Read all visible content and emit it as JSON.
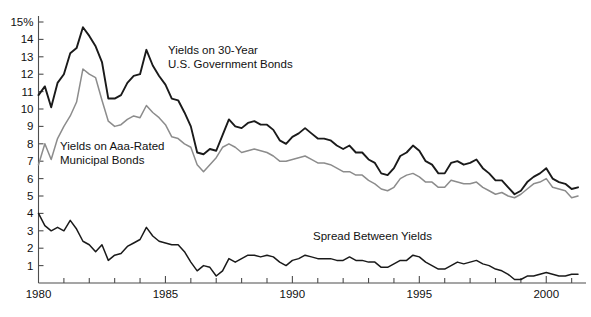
{
  "chart_data": {
    "type": "line",
    "title": "",
    "subtitle": "",
    "xlabel": "",
    "ylabel": "",
    "xlim": [
      1980,
      2001.25
    ],
    "ylim": [
      0,
      15.4
    ],
    "grid": false,
    "legend_position": "inline-annotations",
    "y_ticks": [
      1,
      2,
      3,
      4,
      5,
      6,
      7,
      8,
      9,
      10,
      11,
      12,
      13,
      14,
      15
    ],
    "y_tick_labels": [
      "1",
      "2",
      "3",
      "4",
      "5",
      "6",
      "7",
      "8",
      "9",
      "10",
      "11",
      "12",
      "13",
      "14",
      "15%"
    ],
    "x_ticks": [
      1980,
      1985,
      1990,
      1995,
      2000
    ],
    "x_tick_labels": [
      "1980",
      "1985",
      "1990",
      "2000",
      "2000"
    ],
    "x_minor_tick_step": 1,
    "x": [
      1980.0,
      1980.25,
      1980.5,
      1980.75,
      1981.0,
      1981.25,
      1981.5,
      1981.75,
      1982.0,
      1982.25,
      1982.5,
      1982.75,
      1983.0,
      1983.25,
      1983.5,
      1983.75,
      1984.0,
      1984.25,
      1984.5,
      1984.75,
      1985.0,
      1985.25,
      1985.5,
      1985.75,
      1986.0,
      1986.25,
      1986.5,
      1986.75,
      1987.0,
      1987.25,
      1987.5,
      1987.75,
      1988.0,
      1988.25,
      1988.5,
      1988.75,
      1989.0,
      1989.25,
      1989.5,
      1989.75,
      1990.0,
      1990.25,
      1990.5,
      1990.75,
      1991.0,
      1991.25,
      1991.5,
      1991.75,
      1992.0,
      1992.25,
      1992.5,
      1992.75,
      1993.0,
      1993.25,
      1993.5,
      1993.75,
      1994.0,
      1994.25,
      1994.5,
      1994.75,
      1995.0,
      1995.25,
      1995.5,
      1995.75,
      1996.0,
      1996.25,
      1996.5,
      1996.75,
      1997.0,
      1997.25,
      1997.5,
      1997.75,
      1998.0,
      1998.25,
      1998.5,
      1998.75,
      1999.0,
      1999.25,
      1999.5,
      1999.75,
      2000.0,
      2000.25,
      2000.5,
      2000.75,
      2001.0,
      2001.25
    ],
    "series": [
      {
        "name": "Yields on 30-Year U.S. Government Bonds",
        "color": "#1a1a1a",
        "width": 1.9,
        "values": [
          10.8,
          11.3,
          10.1,
          11.5,
          12.0,
          13.2,
          13.5,
          14.7,
          14.2,
          13.6,
          12.7,
          10.6,
          10.6,
          10.8,
          11.5,
          11.9,
          12.0,
          13.4,
          12.5,
          11.9,
          11.4,
          10.6,
          10.5,
          9.8,
          9.0,
          7.5,
          7.4,
          7.7,
          7.6,
          8.5,
          9.4,
          9.0,
          8.9,
          9.2,
          9.3,
          9.1,
          9.1,
          8.8,
          8.2,
          8.0,
          8.4,
          8.6,
          8.9,
          8.6,
          8.3,
          8.3,
          8.2,
          7.9,
          7.7,
          7.9,
          7.5,
          7.5,
          7.1,
          6.9,
          6.3,
          6.2,
          6.6,
          7.3,
          7.5,
          7.9,
          7.6,
          7.0,
          6.8,
          6.3,
          6.3,
          6.9,
          7.0,
          6.8,
          6.9,
          7.1,
          6.6,
          6.3,
          5.9,
          5.9,
          5.5,
          5.1,
          5.3,
          5.8,
          6.1,
          6.3,
          6.6,
          6.0,
          5.8,
          5.7,
          5.4,
          5.5
        ]
      },
      {
        "name": "Yields on Aaa-Rated Municipal Bonds",
        "color": "#8c8c8c",
        "width": 1.5,
        "values": [
          6.8,
          8.0,
          7.1,
          8.3,
          9.0,
          9.6,
          10.4,
          12.3,
          12.0,
          11.8,
          10.5,
          9.3,
          9.0,
          9.1,
          9.4,
          9.6,
          9.5,
          10.2,
          9.8,
          9.5,
          9.1,
          8.4,
          8.3,
          8.0,
          7.8,
          6.8,
          6.4,
          6.8,
          7.2,
          7.8,
          8.0,
          7.8,
          7.5,
          7.6,
          7.7,
          7.6,
          7.5,
          7.3,
          7.0,
          7.0,
          7.1,
          7.2,
          7.3,
          7.1,
          6.9,
          6.9,
          6.8,
          6.6,
          6.4,
          6.4,
          6.2,
          6.2,
          5.9,
          5.7,
          5.4,
          5.3,
          5.5,
          6.0,
          6.2,
          6.3,
          6.1,
          5.8,
          5.8,
          5.5,
          5.5,
          5.9,
          5.8,
          5.7,
          5.7,
          5.8,
          5.5,
          5.3,
          5.1,
          5.2,
          5.0,
          4.9,
          5.1,
          5.4,
          5.7,
          5.8,
          6.0,
          5.5,
          5.4,
          5.3,
          4.9,
          5.0
        ]
      },
      {
        "name": "Spread Between Yields",
        "color": "#1a1a1a",
        "width": 1.5,
        "values": [
          4.0,
          3.3,
          3.0,
          3.2,
          3.0,
          3.6,
          3.1,
          2.4,
          2.2,
          1.8,
          2.2,
          1.3,
          1.6,
          1.7,
          2.1,
          2.3,
          2.5,
          3.2,
          2.7,
          2.4,
          2.3,
          2.2,
          2.2,
          1.8,
          1.2,
          0.7,
          1.0,
          0.9,
          0.4,
          0.7,
          1.4,
          1.2,
          1.4,
          1.6,
          1.6,
          1.5,
          1.6,
          1.5,
          1.2,
          1.0,
          1.3,
          1.4,
          1.6,
          1.5,
          1.4,
          1.4,
          1.4,
          1.3,
          1.3,
          1.5,
          1.3,
          1.3,
          1.2,
          1.2,
          0.9,
          0.9,
          1.1,
          1.3,
          1.3,
          1.6,
          1.5,
          1.2,
          1.0,
          0.8,
          0.8,
          1.0,
          1.2,
          1.1,
          1.2,
          1.3,
          1.1,
          1.0,
          0.8,
          0.7,
          0.5,
          0.2,
          0.2,
          0.4,
          0.4,
          0.5,
          0.6,
          0.5,
          0.4,
          0.4,
          0.5,
          0.5
        ]
      }
    ],
    "annotations": [
      {
        "id": "treasury-label",
        "lines": [
          "Yields on 30-Year",
          "U.S. Government Bonds"
        ],
        "x": 168,
        "y": 54
      },
      {
        "id": "municipal-label",
        "lines": [
          "Yields on Aaa-Rated",
          "Municipal Bonds"
        ],
        "x": 60,
        "y": 150
      },
      {
        "id": "spread-label",
        "lines": [
          "Spread Between Yields"
        ],
        "x": 313,
        "y": 240
      }
    ]
  },
  "colors": {
    "background": "#ffffff",
    "axis": "#4d4d4d",
    "treasury": "#1a1a1a",
    "municipal": "#8c8c8c",
    "spread": "#1a1a1a",
    "text": "#111111"
  }
}
